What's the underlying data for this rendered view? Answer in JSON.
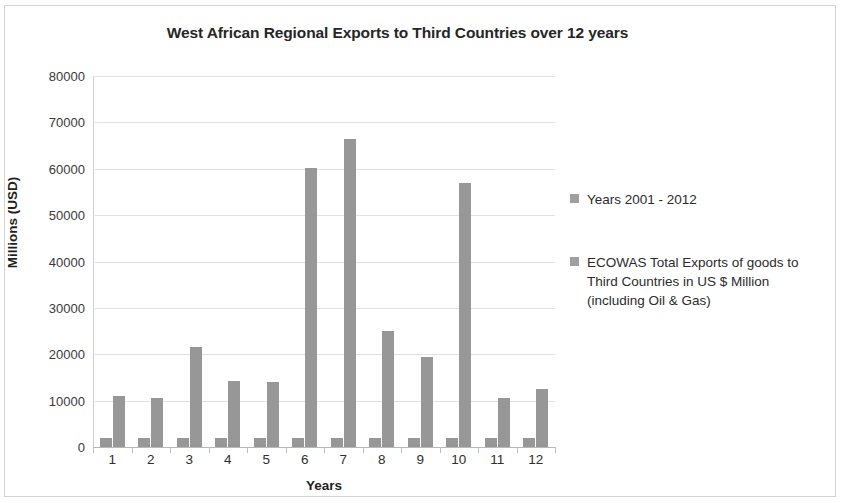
{
  "chart_data": {
    "type": "bar",
    "title": "West African Regional Exports to Third Countries over 12 years",
    "xlabel": "Years",
    "ylabel": "Millions (USD)",
    "categories": [
      "1",
      "2",
      "3",
      "4",
      "5",
      "6",
      "7",
      "8",
      "9",
      "10",
      "11",
      "12"
    ],
    "ylim": [
      0,
      80000
    ],
    "ytick_labels": [
      "80000",
      "70000",
      "60000",
      "50000",
      "40000",
      "30000",
      "20000",
      "10000",
      "0"
    ],
    "ytick_values": [
      80000,
      70000,
      60000,
      50000,
      40000,
      30000,
      20000,
      10000,
      0
    ],
    "grid": true,
    "legend_position": "right",
    "bar_color": "#979797",
    "series": [
      {
        "name": "Years 2001 - 2012",
        "values": [
          2001,
          2002,
          2003,
          2004,
          2005,
          2006,
          2007,
          2008,
          2009,
          2010,
          2011,
          2012
        ]
      },
      {
        "name": "ECOWAS Total Exports of goods to Third Countries in US $ Million (including Oil & Gas)",
        "values": [
          11000,
          10500,
          21500,
          14300,
          14000,
          60200,
          66500,
          25000,
          19500,
          57000,
          10600,
          12500
        ]
      }
    ]
  },
  "legend": {
    "entries": [
      {
        "label": "Years 2001 - 2012",
        "color": "#a0a0a0"
      },
      {
        "label": "ECOWAS Total Exports of goods to Third Countries in US $ Million (including Oil & Gas)",
        "color": "#a0a0a0"
      }
    ]
  }
}
